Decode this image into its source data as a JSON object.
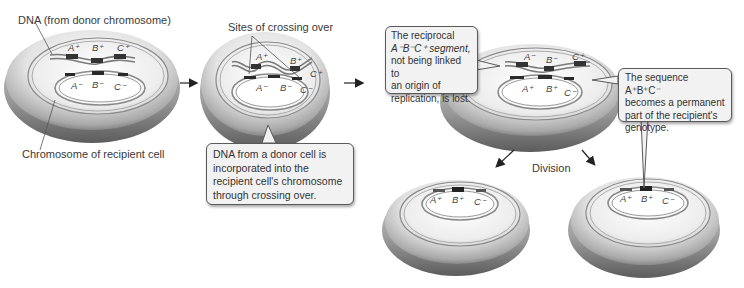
{
  "figure": {
    "panels": [
      {
        "id": "panel-1",
        "labels": {
          "donor_dna": "DNA (from donor chromosome)",
          "recipient_chromosome": "Chromosome of recipient cell"
        },
        "donor_genes": [
          "A⁺",
          "B⁺",
          "C⁺"
        ],
        "recipient_genes": [
          "A⁻",
          "B⁻",
          "C⁻"
        ]
      },
      {
        "id": "panel-2",
        "labels": {
          "crossing_sites": "Sites of crossing over"
        },
        "donor_genes": [
          "A⁺",
          "B⁺",
          "C⁺"
        ],
        "recipient_genes": [
          "A⁻",
          "B⁻",
          "C⁻"
        ],
        "callout_lines": [
          "DNA from a donor cell is",
          "incorporated into the",
          "recipient cell's chromosome",
          "through crossing over."
        ]
      },
      {
        "id": "panel-3",
        "lost_segment_genes": [
          "A⁻",
          "B⁻",
          "C⁺"
        ],
        "chromosome_genes": [
          "A⁺",
          "B⁺",
          "C⁻"
        ],
        "callout_left_lines": [
          "The reciprocal",
          "A⁻B⁻C⁺ segment,",
          "not being linked to",
          "an origin of",
          "replication, is lost."
        ],
        "callout_right_lines": [
          "The sequence A⁺B⁺C⁻",
          "becomes a permanent",
          "part of the recipient's",
          "genotype."
        ],
        "division_label": "Division"
      },
      {
        "id": "daughter-left",
        "chromosome_genes": [
          "A⁺",
          "B⁺",
          "C⁻"
        ]
      },
      {
        "id": "daughter-right",
        "chromosome_genes": [
          "A⁺",
          "B⁺",
          "C⁻"
        ]
      }
    ]
  },
  "colors": {
    "cell_dark": "#6e6e6e",
    "cell_mid": "#bdbdbd",
    "cell_light": "#f4f4f4",
    "dna_strand": "#7a7a7a",
    "gene_band": "#2a2a2a",
    "callout_bg": "#f2f2f2",
    "text": "#3a3a3a"
  }
}
